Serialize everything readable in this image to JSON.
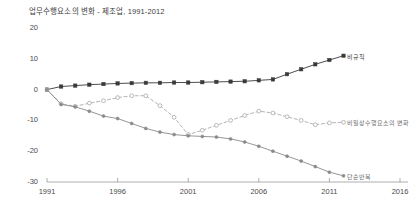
{
  "chart_data": {
    "type": "line",
    "title": "업무수행요소의 변화 - 제조업, 1991-2012",
    "xlabel": "",
    "ylabel": "",
    "xlim": [
      1991,
      2016
    ],
    "ylim": [
      -30,
      20
    ],
    "grid": false,
    "legend_position": "inline-right-of-series-end",
    "x_ticks": [
      "1991",
      "1996",
      "2001",
      "2006",
      "2011",
      "2016"
    ],
    "x_tick_values": [
      1991,
      1996,
      2001,
      2006,
      2011,
      2016
    ],
    "y_ticks": [
      "20",
      "10",
      "0",
      "-10",
      "-20",
      "-30"
    ],
    "y_tick_values": [
      20,
      10,
      0,
      -10,
      -20,
      -30
    ],
    "x": [
      1991,
      1992,
      1993,
      1994,
      1995,
      1996,
      1997,
      1998,
      1999,
      2000,
      2001,
      2002,
      2003,
      2004,
      2005,
      2006,
      2007,
      2008,
      2009,
      2010,
      2011,
      2012
    ],
    "series": [
      {
        "name": "비규칙",
        "label": "비규칙",
        "color": "#3a3a3a",
        "style": "solid",
        "marker": "square",
        "values": [
          0,
          1.0,
          1.3,
          1.6,
          1.8,
          2.0,
          2.1,
          2.2,
          2.2,
          2.3,
          2.3,
          2.4,
          2.5,
          2.6,
          2.7,
          3.0,
          3.3,
          5.0,
          6.6,
          8.2,
          9.6,
          11.0
        ],
        "label_x": 2012,
        "label_y": 11.0
      },
      {
        "name": "비일상수행요소의 변화",
        "label": "비일상수행요소의 변화",
        "color": "#a8a8a8",
        "style": "dashed",
        "marker": "open-circle",
        "values": [
          0,
          -4.6,
          -5.4,
          -4.4,
          -3.6,
          -2.6,
          -2.0,
          -2.0,
          -5.2,
          -9.0,
          -14.6,
          -13.2,
          -11.6,
          -10.0,
          -8.4,
          -7.0,
          -7.6,
          -8.8,
          -10.0,
          -11.4,
          -10.8,
          -10.6
        ],
        "label_x": 2012,
        "label_y": -10.6
      },
      {
        "name": "단순반복",
        "label": "단순반복",
        "color": "#8a8a8a",
        "style": "solid",
        "marker": "circle",
        "values": [
          0,
          -4.8,
          -5.6,
          -7.0,
          -8.6,
          -9.4,
          -11.0,
          -12.6,
          -13.8,
          -14.6,
          -15.0,
          -15.2,
          -15.4,
          -16.0,
          -17.0,
          -18.4,
          -20.0,
          -21.6,
          -23.2,
          -25.0,
          -26.8,
          -28.0
        ],
        "label_x": 2012,
        "label_y": -28.0
      }
    ]
  }
}
